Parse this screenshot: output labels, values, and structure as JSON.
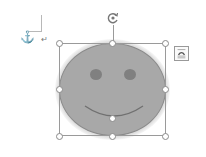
{
  "document": {
    "anchor_glyph": "⚓",
    "paragraph_mark": "↵"
  },
  "shape": {
    "type": "smiley-face",
    "fill_color": "#a8a8a8",
    "outline_color": "#8a8a8a",
    "eye_color": "#808080",
    "selected": true
  },
  "icons": {
    "rotate": "rotate-handle-icon",
    "layout_options": "layout-options-icon",
    "anchor": "anchor-icon"
  }
}
